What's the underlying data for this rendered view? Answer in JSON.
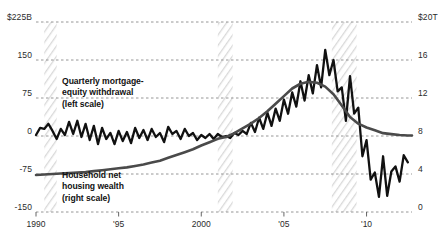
{
  "chart_data": {
    "type": "line",
    "title": "",
    "xlabel": "",
    "ylabel_left": "$225B",
    "ylabel_right": "$20T",
    "grid": true,
    "legend_position": "inline-annotations",
    "xlim": [
      1990,
      2012.75
    ],
    "x_ticks": [
      {
        "value": 1990,
        "label": "1990"
      },
      {
        "value": 1995,
        "label": "'95"
      },
      {
        "value": 2000,
        "label": "2000"
      },
      {
        "value": 2005,
        "label": "'05"
      },
      {
        "value": 2010,
        "label": "'10"
      }
    ],
    "left_axis": {
      "unit": "$B",
      "ylim": [
        -150,
        225
      ],
      "ticks": [
        {
          "value": 225,
          "label": "$225B"
        },
        {
          "value": 150,
          "label": "150"
        },
        {
          "value": 75,
          "label": "75"
        },
        {
          "value": 0,
          "label": "0"
        },
        {
          "value": -75,
          "label": "-75"
        },
        {
          "value": -150,
          "label": "-150"
        }
      ]
    },
    "right_axis": {
      "unit": "$T",
      "ylim": [
        0,
        20
      ],
      "ticks": [
        {
          "value": 20,
          "label": "$20T"
        },
        {
          "value": 16,
          "label": "16"
        },
        {
          "value": 12,
          "label": "12"
        },
        {
          "value": 8,
          "label": "8"
        },
        {
          "value": 4,
          "label": "4"
        },
        {
          "value": 0,
          "label": "0"
        }
      ]
    },
    "annotations": [
      {
        "name": "mew-label",
        "text": "Quarterly mortgage-\nequity withdrawal\n(left scale)",
        "x_px": 62,
        "y_px": 76
      },
      {
        "name": "wealth-label",
        "text": "Household net\nhousing wealth\n(right scale)",
        "x_px": 62,
        "y_px": 170
      }
    ],
    "recession_bands": [
      {
        "start": 1990.5,
        "end": 1991.25
      },
      {
        "start": 2001.0,
        "end": 2001.9
      },
      {
        "start": 2007.9,
        "end": 2009.4
      }
    ],
    "series": [
      {
        "name": "Quarterly mortgage-equity withdrawal",
        "axis": "left",
        "color": "#111111",
        "width": 2.3,
        "x": [
          1990.0,
          1990.25,
          1990.5,
          1990.75,
          1991.0,
          1991.25,
          1991.5,
          1991.75,
          1992.0,
          1992.25,
          1992.5,
          1992.75,
          1993.0,
          1993.25,
          1993.5,
          1993.75,
          1994.0,
          1994.25,
          1994.5,
          1994.75,
          1995.0,
          1995.25,
          1995.5,
          1995.75,
          1996.0,
          1996.25,
          1996.5,
          1996.75,
          1997.0,
          1997.25,
          1997.5,
          1997.75,
          1998.0,
          1998.25,
          1998.5,
          1998.75,
          1999.0,
          1999.25,
          1999.5,
          1999.75,
          2000.0,
          2000.25,
          2000.5,
          2000.75,
          2001.0,
          2001.25,
          2001.5,
          2001.75,
          2002.0,
          2002.25,
          2002.5,
          2002.75,
          2003.0,
          2003.25,
          2003.5,
          2003.75,
          2004.0,
          2004.25,
          2004.5,
          2004.75,
          2005.0,
          2005.25,
          2005.5,
          2005.75,
          2006.0,
          2006.25,
          2006.5,
          2006.75,
          2007.0,
          2007.25,
          2007.5,
          2007.75,
          2008.0,
          2008.25,
          2008.5,
          2008.75,
          2009.0,
          2009.25,
          2009.5,
          2009.75,
          2010.0,
          2010.25,
          2010.5,
          2010.75,
          2011.0,
          2011.25,
          2011.5,
          2011.75,
          2012.0,
          2012.25,
          2012.5
        ],
        "y": [
          2,
          16,
          14,
          24,
          10,
          -6,
          14,
          2,
          28,
          4,
          30,
          -2,
          24,
          -8,
          20,
          -16,
          16,
          -6,
          6,
          -16,
          10,
          -10,
          8,
          -14,
          16,
          -4,
          12,
          -8,
          14,
          -2,
          6,
          -12,
          18,
          4,
          10,
          -6,
          14,
          0,
          6,
          -8,
          2,
          -4,
          4,
          -6,
          4,
          -2,
          0,
          -4,
          6,
          2,
          10,
          4,
          26,
          8,
          36,
          14,
          46,
          20,
          54,
          30,
          72,
          44,
          86,
          58,
          108,
          70,
          120,
          84,
          140,
          96,
          170,
          120,
          150,
          88,
          96,
          30,
          118,
          44,
          56,
          -40,
          -8,
          -86,
          -72,
          -120,
          -40,
          -118,
          -70,
          -60,
          -90,
          -38,
          -52
        ]
      },
      {
        "name": "Household net housing wealth",
        "axis": "right",
        "color": "#4a4a4a",
        "width": 2.6,
        "x": [
          1990.0,
          1990.5,
          1991.0,
          1991.5,
          1992.0,
          1992.5,
          1993.0,
          1993.5,
          1994.0,
          1994.5,
          1995.0,
          1995.5,
          1996.0,
          1996.5,
          1997.0,
          1997.5,
          1998.0,
          1998.5,
          1999.0,
          1999.5,
          2000.0,
          2000.5,
          2001.0,
          2001.5,
          2002.0,
          2002.5,
          2003.0,
          2003.5,
          2004.0,
          2004.5,
          2005.0,
          2005.5,
          2006.0,
          2006.5,
          2007.0,
          2007.5,
          2008.0,
          2008.5,
          2009.0,
          2009.5,
          2010.0,
          2010.5,
          2011.0,
          2011.5,
          2012.0,
          2012.5,
          2012.75
        ],
        "y": [
          3.9,
          3.95,
          4.0,
          4.05,
          4.1,
          4.15,
          4.2,
          4.3,
          4.4,
          4.5,
          4.6,
          4.7,
          4.85,
          5.0,
          5.2,
          5.4,
          5.7,
          6.0,
          6.3,
          6.6,
          7.0,
          7.35,
          7.7,
          7.9,
          8.3,
          8.8,
          9.3,
          9.9,
          10.6,
          11.4,
          12.2,
          13.0,
          13.5,
          13.7,
          13.6,
          13.2,
          12.4,
          11.2,
          10.0,
          9.3,
          8.9,
          8.6,
          8.3,
          8.2,
          8.1,
          8.05,
          8.05
        ]
      }
    ]
  }
}
